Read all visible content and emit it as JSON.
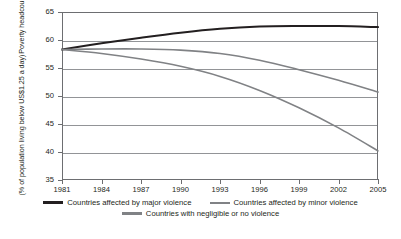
{
  "chart_data": {
    "type": "line",
    "title": "",
    "xlabel": "",
    "ylabel_line1": "Poverty headcount",
    "ylabel_line2": "(% of population living below US$1.25 a day)",
    "x": [
      1981,
      1984,
      1987,
      1990,
      1993,
      1996,
      1999,
      2002,
      2005
    ],
    "xlim": [
      1981,
      2005
    ],
    "ylim": [
      35,
      65
    ],
    "yticks": [
      35,
      40,
      45,
      50,
      55,
      60,
      65
    ],
    "xticks": [
      "1981",
      "1984",
      "1987",
      "1990",
      "1993",
      "1996",
      "1999",
      "2002",
      "2005"
    ],
    "grid": "horizontal",
    "legend_position": "below",
    "series": [
      {
        "name": "Countries affected by major violence",
        "color": "#231f20",
        "values": [
          58.3,
          59.4,
          60.4,
          61.3,
          62.0,
          62.4,
          62.5,
          62.5,
          62.3
        ]
      },
      {
        "name": "Countries affected by minor violence",
        "color": "#808285",
        "values": [
          58.3,
          58.4,
          58.4,
          58.2,
          57.6,
          56.4,
          54.7,
          52.8,
          50.7
        ]
      },
      {
        "name": "Countries with negligible or no violence",
        "color": "#808285",
        "values": [
          58.3,
          57.6,
          56.6,
          55.3,
          53.5,
          51.0,
          47.9,
          44.3,
          40.2
        ]
      }
    ]
  },
  "legend": {
    "items": [
      {
        "label": "Countries affected by major violence"
      },
      {
        "label": "Countries affected by minor violence"
      },
      {
        "label": "Countries with negligible or no violence"
      }
    ]
  },
  "axis": {
    "y_labels": [
      "65",
      "60",
      "55",
      "50",
      "45",
      "40",
      "35"
    ],
    "x_labels": [
      "1981",
      "1984",
      "1987",
      "1990",
      "1993",
      "1996",
      "1999",
      "2002",
      "2005"
    ]
  }
}
